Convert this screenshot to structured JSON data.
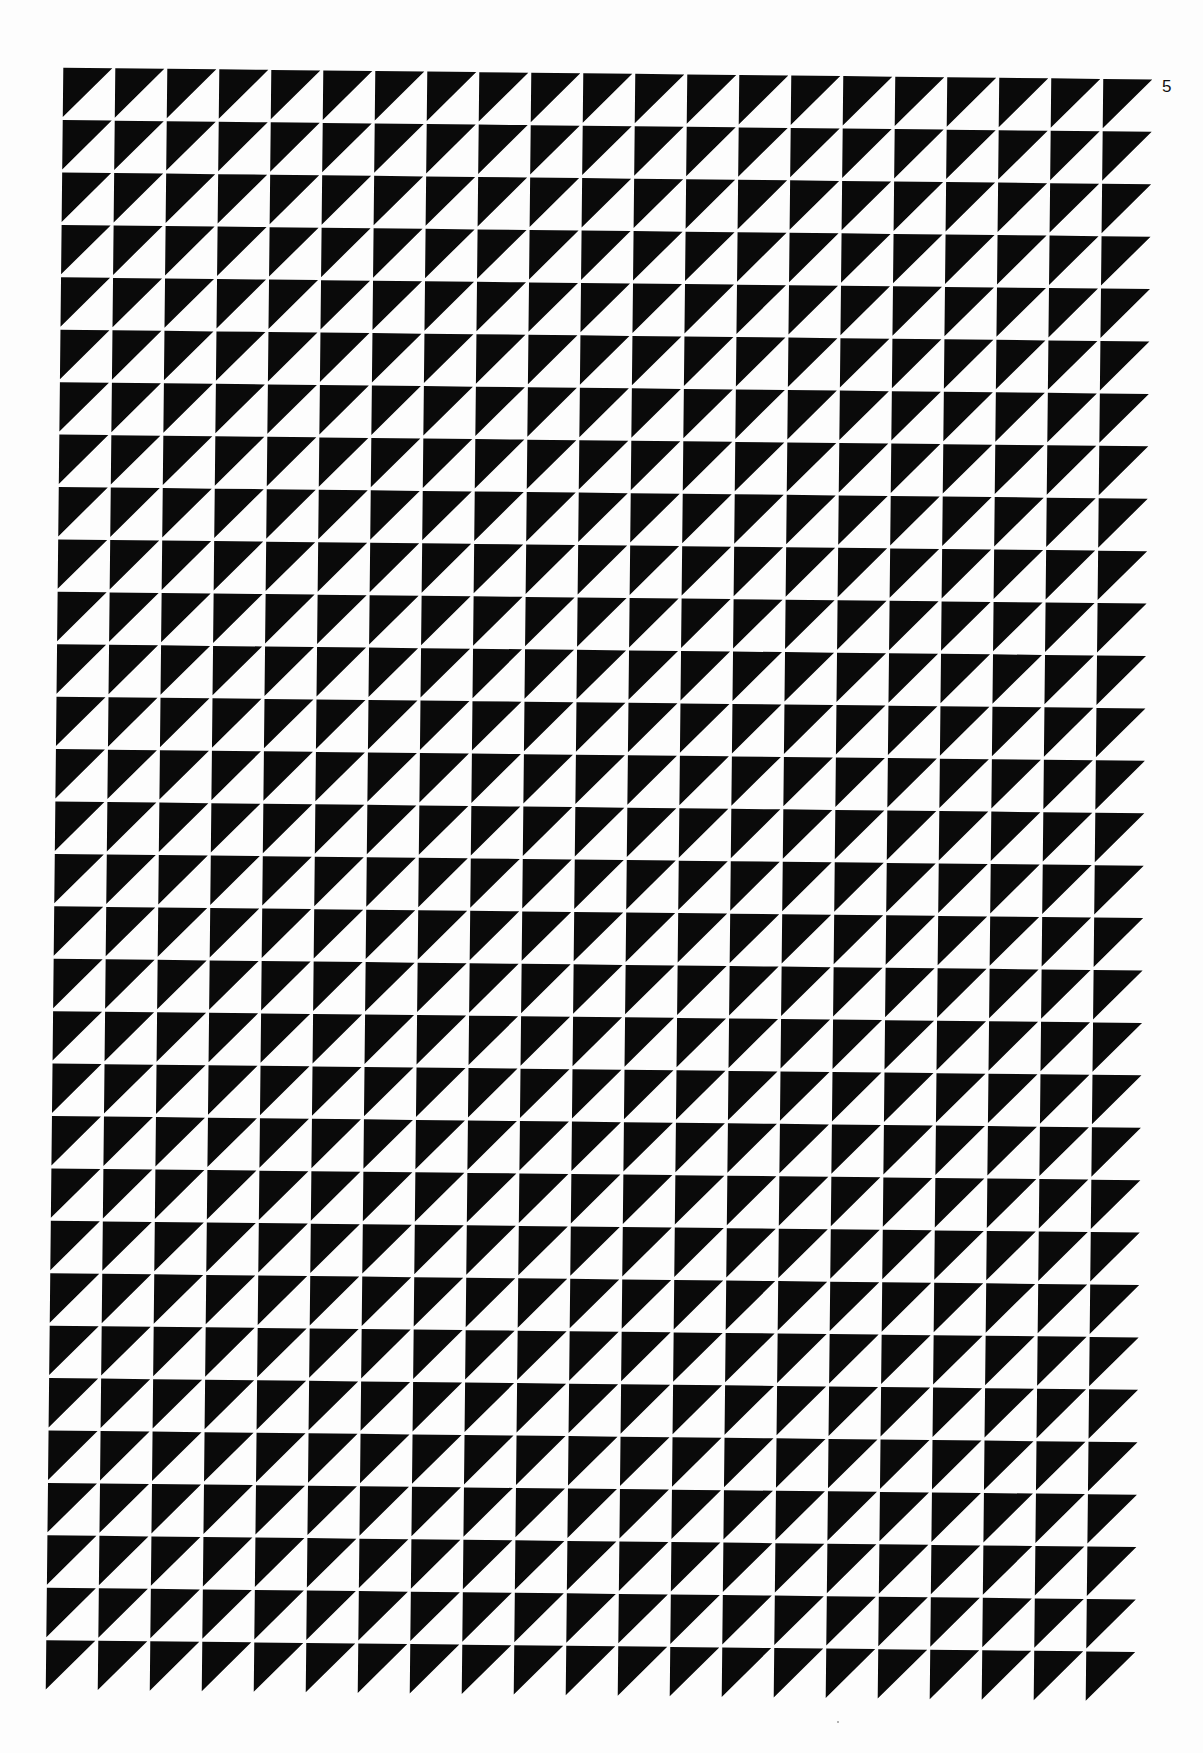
{
  "page": {
    "number": "5",
    "background_color": "#fdfdfd"
  },
  "artwork": {
    "type": "geometric-pattern",
    "description": "Grid of squares, each split diagonally with the upper-left triangle filled black",
    "columns": 21,
    "rows": 31,
    "cell_pitch_px": 52,
    "cell_gap_px": 3,
    "fill_color": "#0a0a0a",
    "ground_color": "#ffffff",
    "triangle_orientation": "upper-left"
  }
}
